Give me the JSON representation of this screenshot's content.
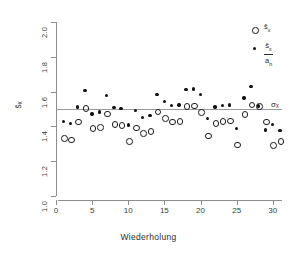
{
  "chart_data": {
    "type": "scatter",
    "title": "",
    "xlabel": "Wiederholung",
    "ylabel": "s̄ₓ",
    "xlim": [
      0,
      31
    ],
    "ylim": [
      1.0,
      2.0
    ],
    "xticks": [
      0,
      5,
      10,
      15,
      20,
      25,
      30
    ],
    "yticks": [
      1.0,
      1.2,
      1.4,
      1.6,
      1.8,
      2.0
    ],
    "grid": false,
    "legend_position": "top-right",
    "reference_line": {
      "label": "σₓ",
      "value": 1.5,
      "orientation": "horizontal",
      "color": "#9a9a9a"
    },
    "x": [
      1,
      2,
      3,
      4,
      5,
      6,
      7,
      8,
      9,
      10,
      11,
      12,
      13,
      14,
      15,
      16,
      17,
      18,
      19,
      20,
      21,
      22,
      23,
      24,
      25,
      26,
      27,
      28,
      29,
      30,
      31
    ],
    "series": [
      {
        "name": "s̄ₓ",
        "marker": "open-circle",
        "color": "#1a1a1a",
        "values": [
          1.335,
          1.327,
          1.43,
          1.508,
          1.392,
          1.399,
          1.478,
          1.416,
          1.411,
          1.318,
          1.396,
          1.364,
          1.378,
          1.488,
          1.45,
          1.432,
          1.435,
          1.52,
          1.523,
          1.486,
          1.35,
          1.424,
          1.433,
          1.436,
          1.3,
          1.474,
          1.529,
          1.52,
          1.432,
          1.297,
          1.32
        ]
      },
      {
        "name": "s̄ₓ/aₙ",
        "marker": "filled-circle",
        "color": "#111111",
        "values": [
          1.428,
          1.418,
          1.512,
          1.606,
          1.472,
          1.482,
          1.578,
          1.508,
          1.504,
          1.407,
          1.492,
          1.45,
          1.462,
          1.583,
          1.543,
          1.519,
          1.524,
          1.613,
          1.616,
          1.584,
          1.444,
          1.511,
          1.52,
          1.522,
          1.388,
          1.563,
          1.63,
          1.518,
          1.379,
          1.412,
          1.378
        ]
      }
    ]
  },
  "legend": {
    "items": [
      {
        "key": "open-circle",
        "label": "s̄ₓ",
        "is_fraction": false
      },
      {
        "key": "filled-circle",
        "label": "s̄ₓ/aₙ",
        "is_fraction": true,
        "numerator": "s̄ₓ",
        "denominator": "aₙ"
      }
    ]
  },
  "axes": {
    "x_title": "Wiederholung",
    "y_title": "s̄ₓ",
    "x_tick_labels": [
      "0",
      "5",
      "10",
      "15",
      "20",
      "25",
      "30"
    ],
    "y_tick_labels": [
      "1.0",
      "1.2",
      "1.4",
      "1.6",
      "1.8",
      "2.0"
    ],
    "sigma_label": "σₓ"
  },
  "colors": {
    "axis": "#8d8d8d",
    "reference_line": "#9a9a9a",
    "open_marker": "#1a1a1a",
    "filled_marker": "#111111",
    "background": "#ffffff",
    "text": "#2b2b2b"
  }
}
